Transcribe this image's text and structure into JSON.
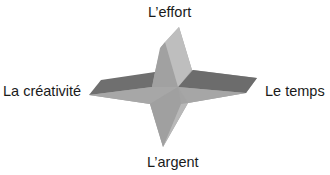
{
  "diagram": {
    "type": "3d-four-pointed-star",
    "labels": {
      "top": "L’effort",
      "left": "La créativité",
      "right": "Le temps",
      "bottom": "L’argent"
    },
    "colors": {
      "background": "#ffffff",
      "face_light": "#bdbdbd",
      "face_mid": "#a9a9a9",
      "face_base": "#9e9e9e",
      "face_dark": "#6f6f6f",
      "text": "#1a1a1a"
    }
  }
}
